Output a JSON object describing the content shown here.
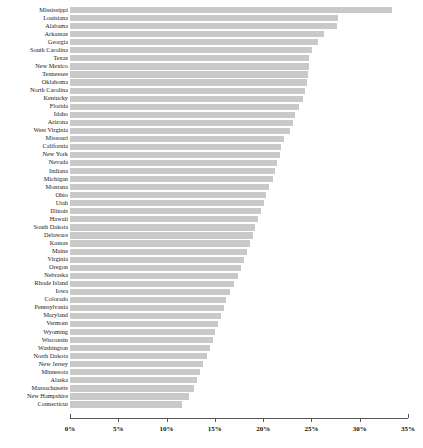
{
  "chart_data": {
    "type": "bar",
    "orientation": "horizontal",
    "title": "",
    "subtitle": "",
    "xlabel": "",
    "ylabel": "",
    "xlim": [
      0,
      35
    ],
    "grid": false,
    "legend": null,
    "bar_color": "#c9c9c9",
    "axis_color": "#555555",
    "xticks": [
      0,
      5,
      10,
      15,
      20,
      25,
      30,
      35
    ],
    "xticklabels": [
      "0%",
      "5%",
      "10%",
      "15%",
      "20%",
      "25%",
      "30%",
      "35%"
    ],
    "categories": [
      "Mississippi",
      "Louisiana",
      "Alabama",
      "Arkansas",
      "Georgia",
      "South Carolina",
      "Texas",
      "New Mexico",
      "Tennessee",
      "Oklahoma",
      "North Carolina",
      "Kentucky",
      "Florida",
      "Idaho",
      "Arizona",
      "West Virginia",
      "Missouri",
      "California",
      "New York",
      "Nevada",
      "Indiana",
      "Michigan",
      "Montana",
      "Ohio",
      "Utah",
      "Illinois",
      "Hawaii",
      "South Dakota",
      "Delaware",
      "Kansas",
      "Maine",
      "Virginia",
      "Oregon",
      "Nebraska",
      "Rhode Island",
      "Iowa",
      "Colorado",
      "Pennsylvania",
      "Maryland",
      "Vermont",
      "Wyoming",
      "Wisconsin",
      "Washington",
      "North Dakota",
      "New Jersey",
      "Minnesota",
      "Alaska",
      "Massachusetts",
      "New Hampshire",
      "Connecticut"
    ],
    "values": [
      33.3,
      27.7,
      27.6,
      26.3,
      25.7,
      25.1,
      24.8,
      24.7,
      24.6,
      24.5,
      24.3,
      24.1,
      23.7,
      23.3,
      23.1,
      22.8,
      22.2,
      21.9,
      21.7,
      21.4,
      21.2,
      21.0,
      20.6,
      20.3,
      20.1,
      19.8,
      19.5,
      19.2,
      19.0,
      18.6,
      18.3,
      18.0,
      17.7,
      17.4,
      17.0,
      16.6,
      16.2,
      15.9,
      15.6,
      15.3,
      15.0,
      14.8,
      14.5,
      14.2,
      13.8,
      13.5,
      13.2,
      12.8,
      12.3,
      11.6
    ]
  }
}
